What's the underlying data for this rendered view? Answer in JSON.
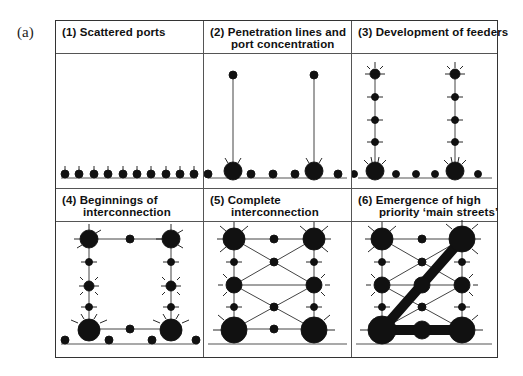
{
  "figure": {
    "label": "(a)",
    "panels": [
      {
        "id": 1,
        "title_line1": "(1) Scattered ports",
        "title_line2": ""
      },
      {
        "id": 2,
        "title_line1": "(2) Penetration lines and",
        "title_line2": "port concentration"
      },
      {
        "id": 3,
        "title_line1": "(3) Development of feeders",
        "title_line2": ""
      },
      {
        "id": 4,
        "title_line1": "(4) Beginnings of",
        "title_line2": "interconnection"
      },
      {
        "id": 5,
        "title_line1": "(5) Complete",
        "title_line2": "interconnection"
      },
      {
        "id": 6,
        "title_line1": "(6) Emergence of high",
        "title_line2": "priority ‘main streets’"
      }
    ]
  },
  "colors": {
    "ink": "#111111",
    "line": "#555555",
    "paper": "#ffffff"
  }
}
